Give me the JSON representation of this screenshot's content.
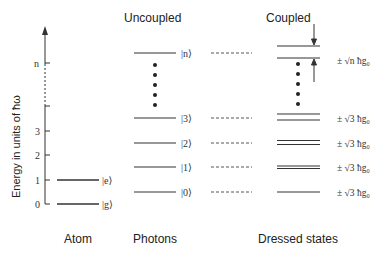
{
  "headers": {
    "uncoupled": "Uncoupled",
    "coupled": "Coupled"
  },
  "axis": {
    "label": "Energy in units of ħω",
    "ticks": [
      "0",
      "1",
      "2",
      "3",
      "n"
    ]
  },
  "columns": {
    "atom": "Atom",
    "photons": "Photons",
    "dressed": "Dressed states"
  },
  "atom_levels": [
    {
      "label": "|g⟩",
      "energy": 0
    },
    {
      "label": "|e⟩",
      "energy": 1
    }
  ],
  "photon_levels": [
    {
      "label": "|0⟩"
    },
    {
      "label": "|1⟩"
    },
    {
      "label": "|2⟩"
    },
    {
      "label": "|3⟩"
    },
    {
      "label": "|n⟩"
    }
  ],
  "dressed_levels": [
    {
      "splitting": "± √3 ħg₀"
    },
    {
      "splitting": "± √3 ħg₀"
    },
    {
      "splitting": "± √3 ħg₀"
    },
    {
      "splitting": "± √3 ħg₀"
    },
    {
      "splitting": "± √n ħg₀"
    }
  ],
  "colors": {
    "line": "#333333",
    "dashed": "#555555"
  }
}
